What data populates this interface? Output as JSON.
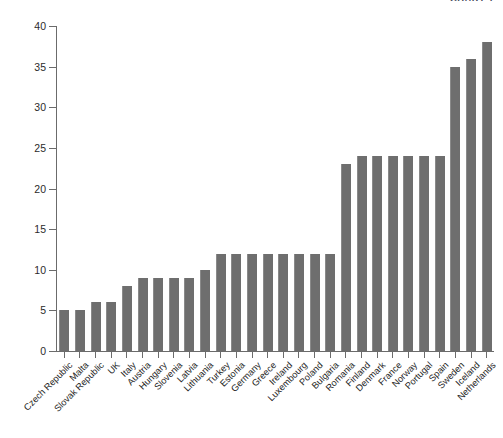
{
  "header": {
    "caption": "CHART 1"
  },
  "chart_data": {
    "type": "bar",
    "title": "",
    "subtitle": "",
    "xlabel": "",
    "ylabel": "",
    "ylim": [
      0,
      40
    ],
    "yticks": [
      0,
      5,
      10,
      15,
      20,
      25,
      30,
      35,
      40
    ],
    "grid": false,
    "legend": null,
    "bar_color": "#6e6e6e",
    "axis_color": "#6b6b6b",
    "categories": [
      "Czech Republic",
      "Malta",
      "Slovak Republic",
      "UK",
      "Italy",
      "Austria",
      "Hungary",
      "Slovenia",
      "Latvia",
      "Lithuania",
      "Turkey",
      "Estonia",
      "Germany",
      "Greece",
      "Ireland",
      "Luxembourg",
      "Poland",
      "Bulgaria",
      "Romania",
      "Finland",
      "Denmark",
      "France",
      "Norway",
      "Portugal",
      "Spain",
      "Sweden",
      "Iceland",
      "Netherlands"
    ],
    "values": [
      5,
      5,
      6,
      6,
      8,
      9,
      9,
      9,
      9,
      10,
      12,
      12,
      12,
      12,
      12,
      12,
      12,
      12,
      23,
      24,
      24,
      24,
      24,
      24,
      24,
      35,
      36,
      38
    ]
  }
}
